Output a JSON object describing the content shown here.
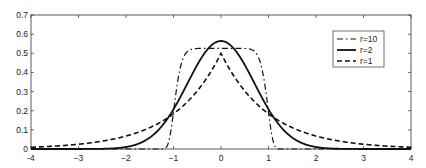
{
  "chart_data": {
    "type": "line",
    "title": "",
    "xlabel": "",
    "ylabel": "",
    "xlim": [
      -4,
      4
    ],
    "ylim": [
      0,
      0.7
    ],
    "xticks": [
      -4,
      -3,
      -2,
      -1,
      0,
      1,
      2,
      3,
      4
    ],
    "xtick_labels": [
      "-4",
      "−3",
      "−2",
      "−1",
      "0",
      "1",
      "2",
      "3",
      "4"
    ],
    "yticks": [
      0,
      0.1,
      0.2,
      0.3,
      0.4,
      0.5,
      0.6,
      0.7
    ],
    "ytick_labels": [
      "0",
      "0.1",
      "0.2",
      "0.3",
      "0.4",
      "0.5",
      "0.6",
      "0.7"
    ],
    "grid": false,
    "legend_position": "upper right",
    "series": [
      {
        "name": "r=10",
        "r": 10,
        "style": "dash-dot",
        "x": [
          -4,
          -3,
          -2,
          -1.2,
          -1.1,
          -1.05,
          -1.0,
          -0.95,
          -0.9,
          -0.5,
          0,
          0.5,
          0.9,
          0.95,
          1.0,
          1.05,
          1.1,
          1.2,
          2,
          3,
          4
        ],
        "values": [
          0,
          0,
          0,
          0.001,
          0.04,
          0.17,
          0.19,
          0.3,
          0.37,
          0.525,
          0.526,
          0.525,
          0.37,
          0.3,
          0.19,
          0.17,
          0.04,
          0.001,
          0,
          0,
          0
        ]
      },
      {
        "name": "r=2",
        "r": 2,
        "style": "solid",
        "x": [
          -4,
          -3,
          -2,
          -1.5,
          -1,
          -0.5,
          0,
          0.5,
          1,
          1.5,
          2,
          3,
          4
        ],
        "values": [
          0.0,
          0.0001,
          0.01,
          0.059,
          0.208,
          0.439,
          0.564,
          0.439,
          0.208,
          0.059,
          0.01,
          0.0001,
          0.0
        ]
      },
      {
        "name": "r=1",
        "r": 1,
        "style": "dashed",
        "x": [
          -4,
          -3,
          -2,
          -1.5,
          -1,
          -0.5,
          0,
          0.5,
          1,
          1.5,
          2,
          3,
          4
        ],
        "values": [
          0.009,
          0.025,
          0.068,
          0.112,
          0.184,
          0.303,
          0.5,
          0.303,
          0.184,
          0.112,
          0.068,
          0.025,
          0.009
        ]
      }
    ]
  }
}
